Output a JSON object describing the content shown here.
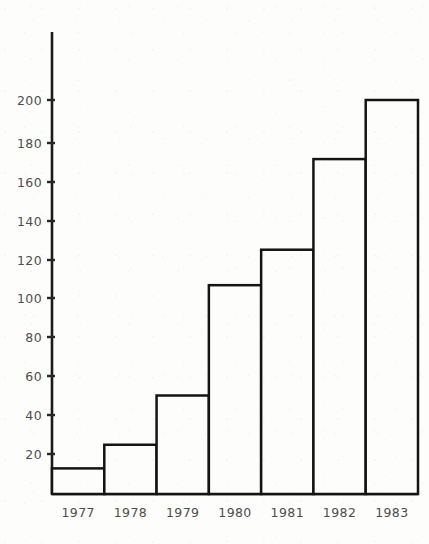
{
  "chart_data": {
    "type": "bar",
    "title": "",
    "subtitle": "",
    "xlabel": "",
    "ylabel": "",
    "categories": [
      "1977",
      "1978",
      "1979",
      "1980",
      "1981",
      "1982",
      "1983"
    ],
    "values": [
      13,
      25,
      50,
      106,
      124,
      170,
      200
    ],
    "ylim": [
      0,
      215
    ],
    "xlim": [
      0,
      7
    ],
    "yticks": [
      20,
      40,
      60,
      80,
      100,
      120,
      140,
      160,
      180,
      200
    ],
    "ytick_labels": [
      "20",
      "40",
      "60",
      "80",
      "100",
      "120",
      "140",
      "160",
      "180",
      "200"
    ],
    "xtick_labels": [
      "1977",
      "1978",
      "1979",
      "1980",
      "1981",
      "1982",
      "1983"
    ],
    "grid": false,
    "legend": false,
    "legend_position": "none",
    "bar_gap": 0,
    "series": [
      {
        "name": "",
        "values": [
          13,
          25,
          50,
          106,
          124,
          170,
          200
        ]
      }
    ],
    "annotations": [],
    "colors": {
      "background": "#fdfdfb",
      "bar_fill": "#fdfdfb",
      "bar_stroke": "#141414",
      "axis": "#1b1b1b",
      "tick_label": "#4d4d4d"
    }
  },
  "figure": {
    "axis_top_value": 215,
    "axis_origin_value": 0
  }
}
